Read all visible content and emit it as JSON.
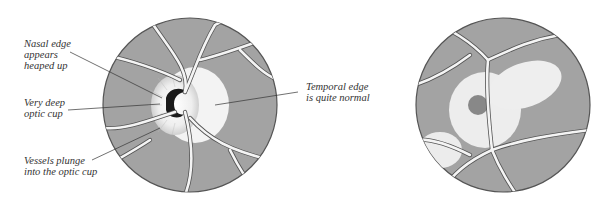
{
  "figure": {
    "left_panel": {
      "annotations": [
        {
          "id": "nasal",
          "lines": [
            "Nasal edge",
            "appears",
            "heaped up"
          ]
        },
        {
          "id": "cup",
          "lines": [
            "Very deep",
            "optic cup"
          ]
        },
        {
          "id": "vessels",
          "lines": [
            "Vessels plunge",
            "into the optic cup"
          ]
        },
        {
          "id": "temporal",
          "lines": [
            "Temporal edge",
            "is quite normal"
          ]
        }
      ]
    },
    "right_panel": {
      "annotations": []
    },
    "colors": {
      "fundus": "#a3a3a3",
      "vessel": "#f4f4f4",
      "outline": "#555555",
      "disc": "#f2f2f2",
      "cup": "#1a1a1a"
    }
  }
}
